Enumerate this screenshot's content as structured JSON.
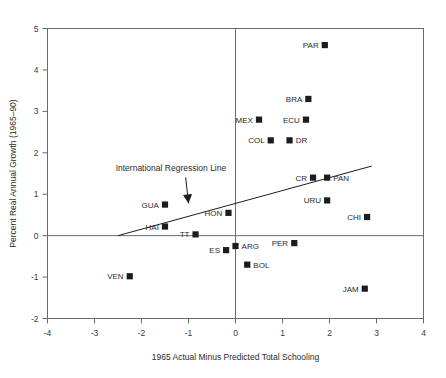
{
  "chart_data": {
    "type": "scatter",
    "title": "",
    "xlabel": "1965 Actual Minus Predicted Total Schooling",
    "ylabel": "Percent Real Annual Growth (1965–90)",
    "xlim": [
      -4,
      4
    ],
    "ylim": [
      -2,
      5
    ],
    "xticks": [
      -4,
      -3,
      -2,
      -1,
      0,
      1,
      2,
      3,
      4
    ],
    "xticklabels": [
      "-4",
      "-3",
      "-2",
      "-1",
      "0",
      "1",
      "2",
      "3",
      "4"
    ],
    "yticks": [
      -2,
      -1,
      0,
      1,
      2,
      3,
      4,
      5
    ],
    "yticklabels": [
      "-2",
      "-1",
      "0",
      "1",
      "2",
      "3",
      "4",
      "5"
    ],
    "grid": false,
    "legend": null,
    "zero_lines": {
      "x": 0,
      "y": 0
    },
    "points": [
      {
        "label": "PAR",
        "x": 1.9,
        "y": 4.6,
        "label_side": "left"
      },
      {
        "label": "BRA",
        "x": 1.55,
        "y": 3.3,
        "label_side": "left"
      },
      {
        "label": "MEX",
        "x": 0.5,
        "y": 2.8,
        "label_side": "left"
      },
      {
        "label": "ECU",
        "x": 1.5,
        "y": 2.8,
        "label_side": "left"
      },
      {
        "label": "COL",
        "x": 0.75,
        "y": 2.3,
        "label_side": "left"
      },
      {
        "label": "DR",
        "x": 1.15,
        "y": 2.3,
        "label_side": "right"
      },
      {
        "label": "CR",
        "x": 1.65,
        "y": 1.4,
        "label_side": "left"
      },
      {
        "label": "PAN",
        "x": 1.95,
        "y": 1.4,
        "label_side": "right"
      },
      {
        "label": "URU",
        "x": 1.95,
        "y": 0.85,
        "label_side": "left"
      },
      {
        "label": "GUA",
        "x": -1.5,
        "y": 0.75,
        "label_side": "left"
      },
      {
        "label": "HON",
        "x": -0.15,
        "y": 0.55,
        "label_side": "left"
      },
      {
        "label": "CHI",
        "x": 2.8,
        "y": 0.45,
        "label_side": "left"
      },
      {
        "label": "HAI",
        "x": -1.5,
        "y": 0.22,
        "label_side": "left"
      },
      {
        "label": "TT",
        "x": -0.85,
        "y": 0.03,
        "label_side": "left"
      },
      {
        "label": "PER",
        "x": 1.25,
        "y": -0.18,
        "label_side": "left"
      },
      {
        "label": "ARG",
        "x": 0.0,
        "y": -0.25,
        "label_side": "right"
      },
      {
        "label": "ES",
        "x": -0.2,
        "y": -0.35,
        "label_side": "left"
      },
      {
        "label": "BOL",
        "x": 0.25,
        "y": -0.7,
        "label_side": "right"
      },
      {
        "label": "VEN",
        "x": -2.25,
        "y": -0.98,
        "label_side": "left"
      },
      {
        "label": "JAM",
        "x": 2.75,
        "y": -1.28,
        "label_side": "left"
      }
    ],
    "regression_line": {
      "label": "International Regression Line",
      "x_start": -2.5,
      "y_start": 0.0,
      "x_end": 2.9,
      "y_end": 1.68
    },
    "annotation": {
      "text": "International Regression Line",
      "text_x": -2.55,
      "text_y": 1.55,
      "arrow_tip_x": -1.0,
      "arrow_tip_y": 0.78
    }
  },
  "colors": {
    "marker": "#1c1c1c",
    "axis": "#6b6b6b",
    "text": "#2b2b2b",
    "background": "#ffffff"
  }
}
